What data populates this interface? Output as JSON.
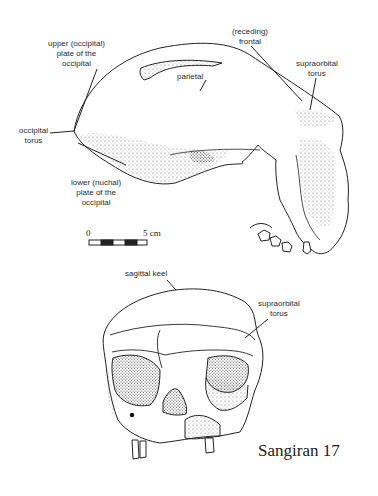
{
  "figure": {
    "title": "Sangiran 17",
    "lateral_view": {
      "labels": {
        "upper_occipital": [
          "upper (occipital)",
          "plate of the",
          "occipital"
        ],
        "receding_frontal": [
          "(receding)",
          "frontal"
        ],
        "supraorbital_torus": [
          "supraorbital",
          "torus"
        ],
        "parietal": [
          "parietal"
        ],
        "occipital_torus": [
          "occipital",
          "torus"
        ],
        "lower_nuchal": [
          "lower (nuchal)",
          "plate of the",
          "occipital"
        ]
      }
    },
    "scale_bar": {
      "start_label": "0",
      "end_label": "5 cm"
    },
    "frontal_view": {
      "labels": {
        "sagittal_keel": [
          "sagittal keel"
        ],
        "supraorbital_torus": [
          "supraorbital",
          "torus"
        ]
      }
    }
  }
}
